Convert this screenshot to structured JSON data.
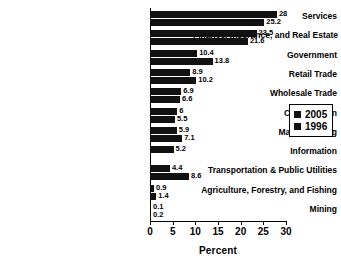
{
  "chart_data": {
    "type": "bar",
    "orientation": "horizontal",
    "title": "",
    "xlabel": "Percent",
    "ylabel": "",
    "xlim": [
      0,
      30
    ],
    "xticks": [
      0,
      5,
      10,
      15,
      20,
      25,
      30
    ],
    "grid": false,
    "legend_position": "right",
    "categories": [
      "Services",
      "Finance, Insurance, and Real Estate",
      "Government",
      "Retail Trade",
      "Wholesale Trade",
      "Construction",
      "Manufacturing",
      "Information",
      "Transportation & Public Utilities",
      "Agriculture, Forestry, and Fishing",
      "Mining"
    ],
    "series": [
      {
        "name": "2005",
        "color": "#111111",
        "values": [
          28,
          23.5,
          10.4,
          8.9,
          6.9,
          6,
          5.9,
          5.2,
          4.4,
          0.9,
          0.1
        ],
        "labels": [
          "28",
          "23.5",
          "10.4",
          "8.9",
          "6.9",
          "6",
          "5.9",
          "5.2",
          "4.4",
          "0.9",
          "0.1"
        ]
      },
      {
        "name": "1996",
        "color": "#111111",
        "values": [
          25.2,
          21.6,
          13.8,
          10.2,
          6.6,
          5.5,
          7.1,
          null,
          8.6,
          1.4,
          0.2
        ],
        "labels": [
          "25.2",
          "21.6",
          "13.8",
          "10.2",
          "6.6",
          "5.5",
          "7.1",
          "",
          "8.6",
          "1.4",
          "0.2"
        ]
      }
    ]
  },
  "legend": {
    "items": [
      {
        "label": "2005"
      },
      {
        "label": "1996"
      }
    ]
  }
}
